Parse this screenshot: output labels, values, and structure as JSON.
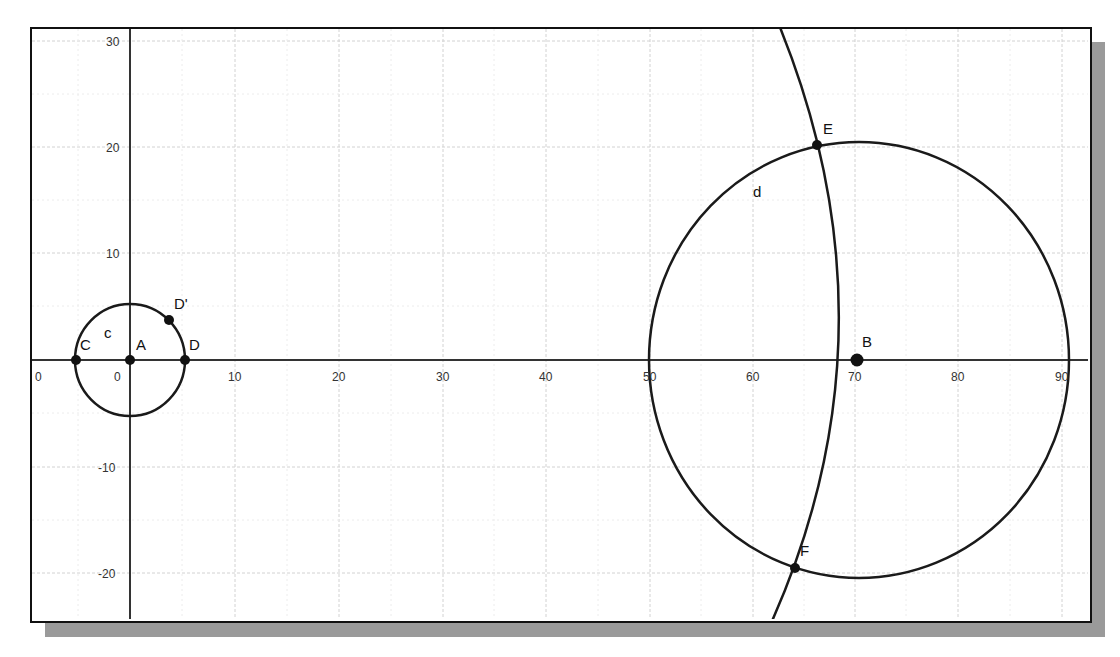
{
  "axes": {
    "x_ticks": [
      {
        "label": "0",
        "x": 40
      },
      {
        "label": "0",
        "x": 118
      },
      {
        "label": "10",
        "x": 235
      },
      {
        "label": "20",
        "x": 339
      },
      {
        "label": "30",
        "x": 443
      },
      {
        "label": "40",
        "x": 546
      },
      {
        "label": "50",
        "x": 650
      },
      {
        "label": "60",
        "x": 753
      },
      {
        "label": "70",
        "x": 855
      },
      {
        "label": "80",
        "x": 958
      },
      {
        "label": "90",
        "x": 1062
      }
    ],
    "y_ticks": [
      {
        "label": "30",
        "y": 41
      },
      {
        "label": "20",
        "y": 147
      },
      {
        "label": "10",
        "y": 253
      },
      {
        "label": "-10",
        "y": 467
      },
      {
        "label": "-20",
        "y": 573
      }
    ]
  },
  "points": {
    "A": "A",
    "B": "B",
    "C": "C",
    "D": "D",
    "D_prime": "D'",
    "E": "E",
    "F": "F"
  },
  "curves": {
    "c": "c",
    "d": "d"
  },
  "colors": {
    "stroke": "#1a1a1a",
    "grid": "#cfcfcf",
    "shadow": "#9a9a9a"
  }
}
